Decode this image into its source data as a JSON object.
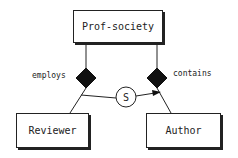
{
  "diagram": {
    "type": "er-diagram",
    "entities": [
      {
        "id": "prof-society",
        "label": "Prof-society"
      },
      {
        "id": "reviewer",
        "label": "Reviewer"
      },
      {
        "id": "author",
        "label": "Author"
      }
    ],
    "relationships": [
      {
        "id": "employs",
        "label": "employs",
        "from": "prof-society",
        "to": "reviewer"
      },
      {
        "id": "contains",
        "label": "contains",
        "from": "prof-society",
        "to": "author"
      }
    ],
    "connector": {
      "label": "S",
      "from": "employs-link",
      "to": "contains-link",
      "arrow": true
    }
  },
  "colors": {
    "stroke": "#222222",
    "fill": "#111111",
    "background": "#ffffff"
  }
}
